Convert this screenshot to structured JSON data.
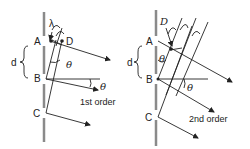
{
  "panels": [
    {
      "id": "first-order",
      "labels": {
        "slit_a": "A",
        "slit_b": "B",
        "slit_c": "C",
        "point_d": "D",
        "spacing": "d",
        "wavelength": "λ",
        "angle_top": "θ",
        "angle_bottom": "θ",
        "order": "1st order"
      }
    },
    {
      "id": "second-order",
      "labels": {
        "slit_a": "A",
        "slit_b": "B",
        "slit_c": "C",
        "point_d": "D",
        "spacing": "d",
        "angle_top": "θ",
        "angle_bottom": "θ",
        "order": "2nd order"
      }
    }
  ],
  "colors": {
    "grating": "#8a8a8a",
    "lines": "#222222",
    "background": "#ffffff"
  }
}
